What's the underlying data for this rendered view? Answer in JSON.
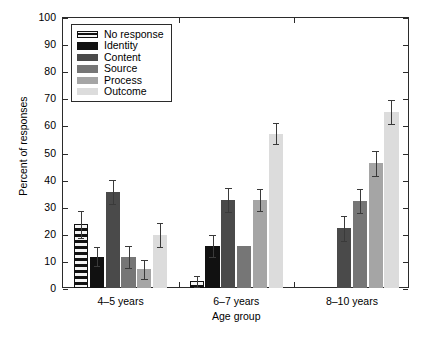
{
  "chart_data": {
    "type": "bar",
    "title": "",
    "xlabel": "Age group",
    "ylabel": "Percent of responses",
    "categories": [
      "4–5 years",
      "6–7 years",
      "8–10 years"
    ],
    "ylim": [
      0,
      100
    ],
    "yticks": [
      0,
      10,
      20,
      30,
      40,
      50,
      60,
      70,
      80,
      90,
      100
    ],
    "ytick_labels": [
      "0",
      "10",
      "20",
      "30",
      "40",
      "50",
      "60",
      "70",
      "80",
      "90",
      "100"
    ],
    "grid": false,
    "legend_position": "upper left",
    "error_bars": "symmetric",
    "series": [
      {
        "name": "No response",
        "color": "#111111",
        "pattern": "horizontal-stripes",
        "values": [
          23.5,
          2.5,
          0
        ],
        "errors": [
          5.0,
          2.0,
          0
        ]
      },
      {
        "name": "Identity",
        "color": "#111111",
        "pattern": "solid",
        "values": [
          11.5,
          15.5,
          0
        ],
        "errors": [
          3.5,
          4.0,
          0
        ]
      },
      {
        "name": "Content",
        "color": "#4a4a4a",
        "pattern": "solid",
        "values": [
          35.5,
          32.5,
          22.0
        ],
        "errors": [
          4.5,
          4.5,
          4.5
        ]
      },
      {
        "name": "Source",
        "color": "#767676",
        "pattern": "solid",
        "values": [
          11.5,
          15.5,
          32.0
        ],
        "errors": [
          4.0,
          0,
          4.5
        ]
      },
      {
        "name": "Process",
        "color": "#a5a5a5",
        "pattern": "solid",
        "values": [
          7.0,
          32.5,
          46.0
        ],
        "errors": [
          3.5,
          4.0,
          4.5
        ]
      },
      {
        "name": "Outcome",
        "color": "#dcdcdc",
        "pattern": "solid",
        "values": [
          19.5,
          57.0,
          65.0
        ],
        "errors": [
          4.5,
          4.0,
          4.5
        ]
      }
    ]
  }
}
